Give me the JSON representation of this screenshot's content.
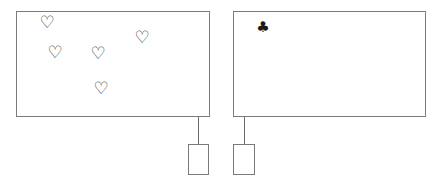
{
  "left_panel": {
    "suit": "hearts",
    "icon": "heart-outline-icon",
    "glyph": "♡",
    "count": 5,
    "items": [
      {
        "x": 47,
        "y": 22
      },
      {
        "x": 142,
        "y": 37
      },
      {
        "x": 55,
        "y": 52
      },
      {
        "x": 98,
        "y": 53
      },
      {
        "x": 101,
        "y": 88
      }
    ]
  },
  "right_panel": {
    "suit": "clubs",
    "icon": "club-icon",
    "glyph": "♣",
    "count": 1,
    "items": [
      {
        "x": 263,
        "y": 27
      }
    ]
  },
  "colors": {
    "border": "#7a7a7a",
    "glyph": "#333333",
    "background": "#ffffff"
  }
}
